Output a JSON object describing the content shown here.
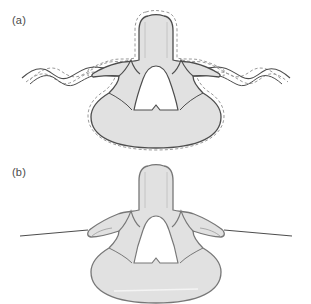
{
  "figure": {
    "background_color": "#ffffff"
  },
  "style": {
    "bone_fill": "#e1e1e1",
    "bone_stroke": "#4d4d4d",
    "foramen_fill": "#ffffff",
    "dashed_stroke": "#9a9a9a",
    "tissue_line_stroke": "#4d4d4d",
    "highlight_stroke": "#f4f4f4",
    "label_color": "#4a4a4a"
  },
  "panels": [
    {
      "id": "a",
      "label": "(a)",
      "description": "Lumbar vertebra axial cross-section with undulating soft-tissue contour and dashed offset outline",
      "has_dashed_outline": true,
      "tissue_contour": "wavy",
      "parts": [
        "spinous-process",
        "lamina",
        "superior-articular-process",
        "transverse-process",
        "pedicle",
        "vertebral-body",
        "vertebral-foramen"
      ]
    },
    {
      "id": "b",
      "label": "(b)",
      "description": "Lumbar vertebra axial cross-section with straight horizontal soft-tissue line and no dashed outline",
      "has_dashed_outline": false,
      "tissue_contour": "straight",
      "parts": [
        "spinous-process",
        "lamina",
        "superior-articular-process",
        "transverse-process",
        "pedicle",
        "vertebral-body",
        "vertebral-foramen"
      ]
    }
  ]
}
